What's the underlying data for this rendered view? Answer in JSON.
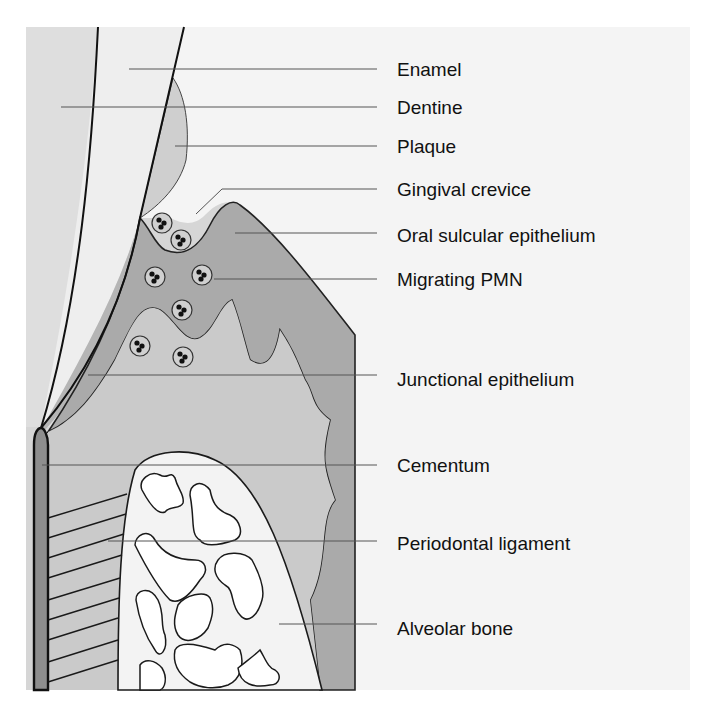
{
  "figure": {
    "colors": {
      "page_bg": "#ffffff",
      "right_panel_bg": "#f4f4f4",
      "left_strip": "#dcdcdc",
      "dentine": "#ececec",
      "enamel": "#f2f2f2",
      "plaque": "#cfcfcf",
      "gingiva_light": "#d6d6d6",
      "sulcular_epithelium": "#aaaaaa",
      "connective": "#c9c9c9",
      "bone": "#f3f3f3",
      "cementum": "#8e8e8e",
      "outline": "#1a1a1a",
      "leader_line": "#555555"
    }
  },
  "labels": [
    {
      "id": "enamel",
      "text": "Enamel",
      "y": 69
    },
    {
      "id": "dentine",
      "text": "Dentine",
      "y": 107
    },
    {
      "id": "plaque",
      "text": "Plaque",
      "y": 146
    },
    {
      "id": "gingival-crevice",
      "text": "Gingival crevice",
      "y": 189
    },
    {
      "id": "oral-sulcular-epithelium",
      "text": "Oral sulcular epithelium",
      "y": 235
    },
    {
      "id": "migrating-pmn",
      "text": "Migrating PMN",
      "y": 279
    },
    {
      "id": "junctional-epithelium",
      "text": "Junctional epithelium",
      "y": 379
    },
    {
      "id": "cementum",
      "text": "Cementum",
      "y": 465
    },
    {
      "id": "periodontal-ligament",
      "text": "Periodontal ligament",
      "y": 543
    },
    {
      "id": "alveolar-bone",
      "text": "Alveolar bone",
      "y": 628
    }
  ]
}
